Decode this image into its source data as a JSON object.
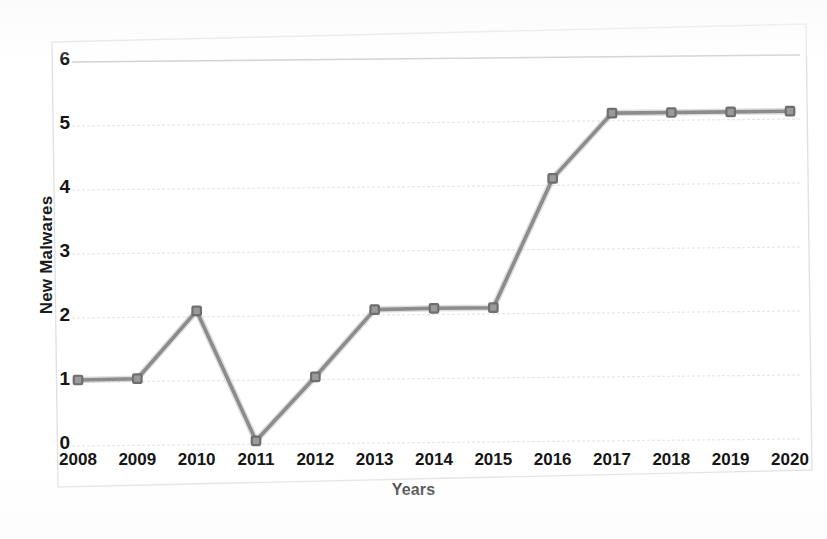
{
  "chart_data": {
    "type": "line",
    "title": "",
    "subtitle": "",
    "xlabel": "Years",
    "ylabel": "New Malwares",
    "categories": [
      "2008",
      "2009",
      "2010",
      "2011",
      "2012",
      "2013",
      "2014",
      "2015",
      "2016",
      "2017",
      "2018",
      "2019",
      "2020"
    ],
    "x": [
      2008,
      2009,
      2010,
      2011,
      2012,
      2013,
      2014,
      2015,
      2016,
      2017,
      2018,
      2019,
      2020
    ],
    "values": [
      1.0,
      1.02,
      2.08,
      0.05,
      1.05,
      2.1,
      2.12,
      2.13,
      4.15,
      5.17,
      5.18,
      5.19,
      5.2
    ],
    "series": [
      {
        "name": "New Malwares",
        "values": [
          1.0,
          1.02,
          2.08,
          0.05,
          1.05,
          2.1,
          2.12,
          2.13,
          4.15,
          5.17,
          5.18,
          5.19,
          5.2
        ]
      }
    ],
    "ylim": [
      0,
      6
    ],
    "y_ticks": [
      0,
      1,
      2,
      3,
      4,
      5,
      6
    ],
    "y_tick_labels": [
      "0",
      "1",
      "2",
      "3",
      "4",
      "5",
      "6"
    ],
    "xlim": [
      2008,
      2020
    ],
    "grid": true,
    "grid_axis": "y",
    "legend": false,
    "legend_position": "none",
    "marker": "square",
    "line_color": "#8c8c8c",
    "marker_color": "#6e6e6e",
    "grid_color": "#e2e2e2",
    "frame_color": "#dcdcdc",
    "text_color": "#151515",
    "background_color": "#ffffff",
    "annotations": []
  },
  "axes": {
    "y_title": "New Malwares",
    "x_title": "Years"
  }
}
